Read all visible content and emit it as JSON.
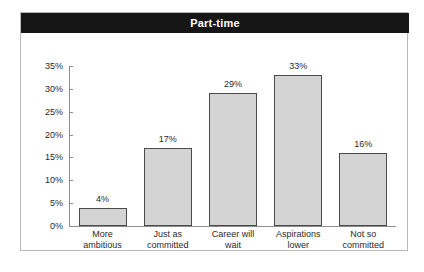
{
  "figure": {
    "title": "Part-time",
    "title_band_color": "#161616",
    "title_text_color": "#ffffff",
    "frame_color": "#b9b9b9",
    "background": "#ffffff"
  },
  "chart_data": {
    "type": "bar",
    "title": "Part-time",
    "xlabel": "",
    "ylabel": "",
    "categories": [
      "More ambitious",
      "Just as committed",
      "Career will wait",
      "Aspirations lower",
      "Not so committed"
    ],
    "category_lines": [
      [
        "More",
        "ambitious"
      ],
      [
        "Just as",
        "committed"
      ],
      [
        "Career will",
        "wait"
      ],
      [
        "Aspirations",
        "lower"
      ],
      [
        "Not so",
        "committed"
      ]
    ],
    "values": [
      4,
      17,
      29,
      33,
      16
    ],
    "value_labels": [
      "4%",
      "17%",
      "29%",
      "33%",
      "16%"
    ],
    "ylim": [
      0,
      35
    ],
    "yticks": [
      0,
      5,
      10,
      15,
      20,
      25,
      30,
      35
    ],
    "ytick_labels": [
      "0%",
      "5%",
      "10%",
      "15%",
      "20%",
      "25%",
      "30%",
      "35%"
    ],
    "grid": false,
    "legend": null,
    "bar_fill_color": "#d4d4d4",
    "bar_border_color": "#4a4a4a",
    "axis_color": "#8d8d8d"
  }
}
